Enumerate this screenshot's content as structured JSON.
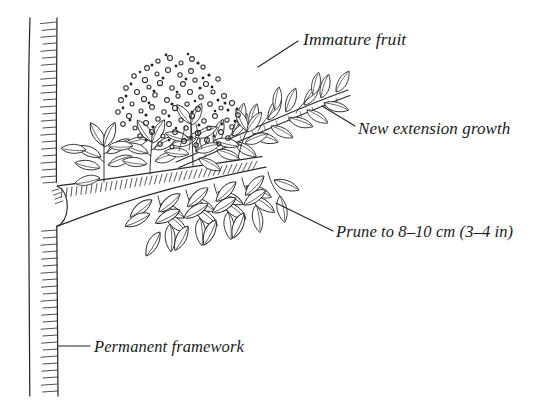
{
  "figure": {
    "width": 554,
    "height": 414,
    "background_color": "#ffffff",
    "ink_color": "#1b1b1b"
  },
  "labels": {
    "immature_fruit": "Immature fruit",
    "new_extension_growth": "New extension growth",
    "prune_to": "Prune to 8–10 cm (3–4 in)",
    "permanent_framework": "Permanent framework"
  },
  "measurements": {
    "prune_length_metric": "8–10 cm",
    "prune_length_imperial": "3–4 in"
  },
  "parts": [
    {
      "name": "permanent-framework-trunk",
      "label": "Permanent framework"
    },
    {
      "name": "main-branch",
      "label": "Main horizontal branch"
    },
    {
      "name": "new-extension-growth-shoot",
      "label": "New extension growth"
    },
    {
      "name": "immature-fruit-cluster",
      "label": "Immature fruit"
    },
    {
      "name": "leafy-spurs",
      "label": "Leafy spurs"
    }
  ]
}
